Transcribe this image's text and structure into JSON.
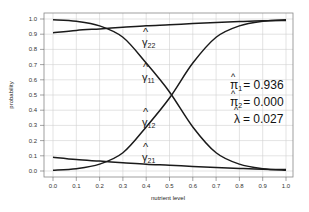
{
  "chart_data": {
    "type": "line",
    "title": "",
    "xlabel": "nutrient level",
    "ylabel": "probability",
    "xlim": [
      0.0,
      1.0
    ],
    "ylim": [
      0.0,
      1.0
    ],
    "grid": true,
    "x_ticks": [
      "0.0",
      "0.1",
      "0.2",
      "0.3",
      "0.4",
      "0.5",
      "0.6",
      "0.7",
      "0.8",
      "0.9",
      "1.0"
    ],
    "y_ticks": [
      "0.0",
      "0.1",
      "0.2",
      "0.3",
      "0.4",
      "0.5",
      "0.6",
      "0.7",
      "0.8",
      "0.9",
      "1.0"
    ],
    "x": [
      0.0,
      0.1,
      0.2,
      0.3,
      0.4,
      0.5,
      0.6,
      0.7,
      0.8,
      0.9,
      1.0
    ],
    "series": [
      {
        "name": "γ̂11",
        "label": "γ",
        "sub": "11",
        "values": [
          0.995,
          0.985,
          0.955,
          0.88,
          0.71,
          0.52,
          0.29,
          0.12,
          0.045,
          0.015,
          0.005
        ]
      },
      {
        "name": "γ̂12",
        "label": "γ",
        "sub": "12",
        "values": [
          0.005,
          0.015,
          0.045,
          0.12,
          0.29,
          0.48,
          0.71,
          0.88,
          0.955,
          0.985,
          0.995
        ]
      },
      {
        "name": "γ̂22",
        "label": "γ",
        "sub": "22",
        "values": [
          0.91,
          0.925,
          0.935,
          0.945,
          0.955,
          0.962,
          0.97,
          0.977,
          0.983,
          0.988,
          0.99
        ]
      },
      {
        "name": "γ̂21",
        "label": "γ",
        "sub": "21",
        "values": [
          0.09,
          0.075,
          0.065,
          0.055,
          0.045,
          0.038,
          0.03,
          0.023,
          0.017,
          0.012,
          0.01
        ]
      }
    ],
    "annotations": [
      {
        "symbol": "π̂",
        "sub": "1",
        "text": "= 0.936"
      },
      {
        "symbol": "π̂",
        "sub": "2",
        "text": "= 0.000"
      },
      {
        "symbol": "λ̂",
        "sub": "",
        "text": "= 0.027"
      }
    ],
    "line_color": "#1a1a1a",
    "grid_color": "#d0d0d0",
    "box_color": "#888888"
  }
}
